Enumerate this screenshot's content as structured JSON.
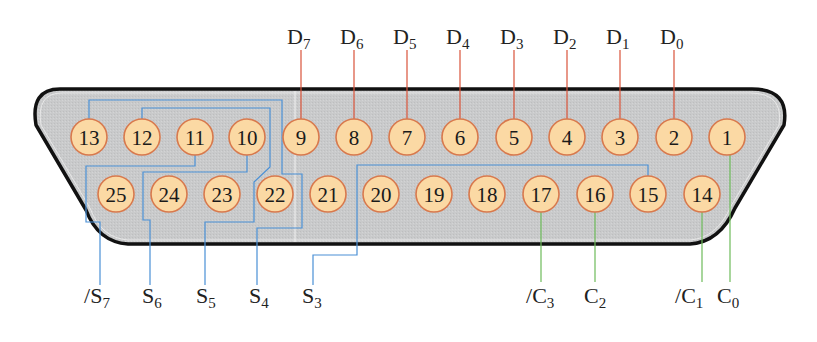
{
  "diagram": {
    "type": "DB-25 parallel port connector pinout",
    "colors": {
      "shell_fill": "#c9cacb",
      "shell_outline": "#111111",
      "pin_fill": "#fbd9a4",
      "pin_stroke": "#d8794d",
      "data_wire": "#d9533a",
      "status_wire": "#4a90d6",
      "control_wire": "#6dbb5a"
    },
    "pins_top_row": [
      {
        "num": "13",
        "x": 89
      },
      {
        "num": "12",
        "x": 142
      },
      {
        "num": "11",
        "x": 195
      },
      {
        "num": "10",
        "x": 247
      },
      {
        "num": "9",
        "x": 301
      },
      {
        "num": "8",
        "x": 354
      },
      {
        "num": "7",
        "x": 407
      },
      {
        "num": "6",
        "x": 460
      },
      {
        "num": "5",
        "x": 514
      },
      {
        "num": "4",
        "x": 567
      },
      {
        "num": "3",
        "x": 620
      },
      {
        "num": "2",
        "x": 674
      },
      {
        "num": "1",
        "x": 727
      }
    ],
    "pins_bottom_row": [
      {
        "num": "25",
        "x": 116
      },
      {
        "num": "24",
        "x": 169
      },
      {
        "num": "23",
        "x": 222
      },
      {
        "num": "22",
        "x": 275
      },
      {
        "num": "21",
        "x": 328
      },
      {
        "num": "20",
        "x": 381
      },
      {
        "num": "19",
        "x": 434
      },
      {
        "num": "18",
        "x": 487
      },
      {
        "num": "17",
        "x": 541
      },
      {
        "num": "16",
        "x": 595
      },
      {
        "num": "15",
        "x": 648
      },
      {
        "num": "14",
        "x": 702
      }
    ],
    "data_labels": [
      {
        "prefix": "",
        "base": "D",
        "sub": "7",
        "pin": "9"
      },
      {
        "prefix": "",
        "base": "D",
        "sub": "6",
        "pin": "8"
      },
      {
        "prefix": "",
        "base": "D",
        "sub": "5",
        "pin": "7"
      },
      {
        "prefix": "",
        "base": "D",
        "sub": "4",
        "pin": "6"
      },
      {
        "prefix": "",
        "base": "D",
        "sub": "3",
        "pin": "5"
      },
      {
        "prefix": "",
        "base": "D",
        "sub": "2",
        "pin": "4"
      },
      {
        "prefix": "",
        "base": "D",
        "sub": "1",
        "pin": "3"
      },
      {
        "prefix": "",
        "base": "D",
        "sub": "0",
        "pin": "2"
      }
    ],
    "status_labels": [
      {
        "prefix": "/",
        "base": "S",
        "sub": "7",
        "pin": "11"
      },
      {
        "prefix": "",
        "base": "S",
        "sub": "6",
        "pin": "10"
      },
      {
        "prefix": "",
        "base": "S",
        "sub": "5",
        "pin": "12"
      },
      {
        "prefix": "",
        "base": "S",
        "sub": "4",
        "pin": "13"
      },
      {
        "prefix": "",
        "base": "S",
        "sub": "3",
        "pin": "15"
      }
    ],
    "control_labels": [
      {
        "prefix": "/",
        "base": "C",
        "sub": "3",
        "pin": "17"
      },
      {
        "prefix": "",
        "base": "C",
        "sub": "2",
        "pin": "16"
      },
      {
        "prefix": "/",
        "base": "C",
        "sub": "1",
        "pin": "14"
      },
      {
        "prefix": "",
        "base": "C",
        "sub": "0",
        "pin": "1"
      }
    ]
  }
}
